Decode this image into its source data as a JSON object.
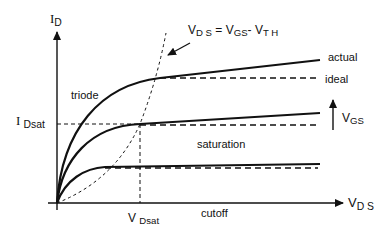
{
  "diagram": {
    "axes": {
      "y_label": {
        "main": "I",
        "sub": "D"
      },
      "x_label": {
        "main": "V",
        "sub": "D S"
      }
    },
    "equation": {
      "v1": "V",
      "s1": "D S",
      "eq": " = ",
      "v2": "V",
      "s2": "GS",
      "minus": "- ",
      "v3": "V",
      "s3": "T H"
    },
    "labels": {
      "actual": "actual",
      "ideal": "ideal",
      "triode": "triode",
      "saturation": "saturation",
      "cutoff": "cutoff",
      "idsat": {
        "main": "I",
        "sub": "Dsat"
      },
      "vdsat": {
        "main": "V",
        "sub": "Dsat"
      },
      "vgs": {
        "main": "V",
        "sub": "GS"
      }
    },
    "curves": [
      {
        "name": "high-vgs",
        "sat_y": 78,
        "actual_end_y": 60
      },
      {
        "name": "mid-vgs",
        "sat_y": 124,
        "actual_end_y": 113
      },
      {
        "name": "low-vgs",
        "sat_y": 167,
        "actual_end_y": 164
      }
    ],
    "colors": {
      "line": "#111111",
      "background": "#ffffff"
    }
  }
}
